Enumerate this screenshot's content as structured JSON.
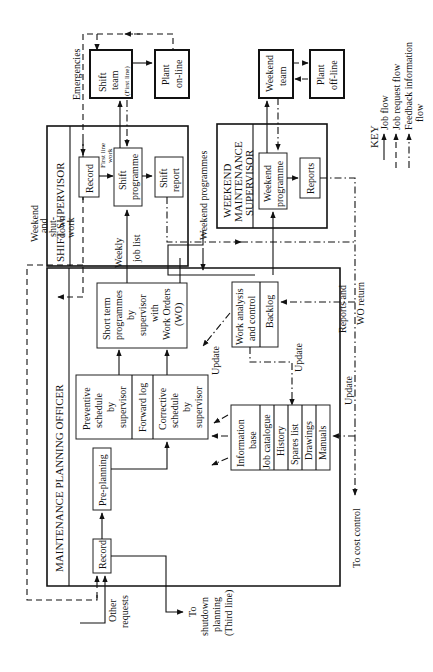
{
  "diagram": {
    "orientation": "rotated-90-ccw",
    "groups": {
      "shift_supervisor": "SHIFT SUPERVISOR",
      "weekend_supervisor": [
        "WEEKEND",
        "MAINTENANCE",
        "SUPERVISOR"
      ],
      "planning_officer": "MAINTENANCE PLANNING OFFICER"
    },
    "nodes": {
      "shift_team": [
        "Shift",
        "team",
        "(First line)"
      ],
      "plant_online": [
        "Plant",
        "on-line"
      ],
      "weekend_team": [
        "Weekend",
        "team"
      ],
      "plant_offline": [
        "Plant",
        "off-line"
      ],
      "shift_record": "Record",
      "shift_programme": [
        "Shift",
        "programme"
      ],
      "shift_report": [
        "Shift",
        "report"
      ],
      "weekend_programme": [
        "Weekend",
        "programme"
      ],
      "reports": "Reports",
      "short_term": [
        "Short term",
        "programmes",
        "by",
        "supervisor",
        "with",
        "Work Orders",
        "(WO)"
      ],
      "preventive": [
        "Preventive",
        "schedule",
        "by",
        "supervisor"
      ],
      "forward_log": "Forward log",
      "corrective": [
        "Corrective",
        "schedule",
        "by",
        "supervisor"
      ],
      "work_analysis": [
        "Work analysis",
        "and control"
      ],
      "backlog": "Backlog",
      "info_base": [
        "Information",
        "base"
      ],
      "info_items": [
        "Job catalogue",
        "History",
        "Spares list",
        "Drawings",
        "Manuals"
      ],
      "pre_planning": "Pre-planning",
      "po_record": "Record"
    },
    "labels": {
      "emergencies": "Emergencies",
      "first_line_work": [
        "First line",
        "work"
      ],
      "weekend_programmes": "Weekend programmes",
      "weekend_shutdown": [
        "Weekend",
        "and",
        "shut-",
        "down",
        "work"
      ],
      "weekly_job_list": [
        "Weekly",
        "job list"
      ],
      "reports_wo_return": [
        "Reports and",
        "WO return"
      ],
      "update": "Update",
      "to_cost_control": "To cost control",
      "other_requests": [
        "Other",
        "requests"
      ],
      "to_shutdown": [
        "To",
        "shutdown",
        "planning",
        "(Third line)"
      ]
    },
    "key": {
      "title": "KEY",
      "items": [
        "Job flow",
        "Job request flow",
        "Feedback information",
        "flow"
      ]
    }
  }
}
